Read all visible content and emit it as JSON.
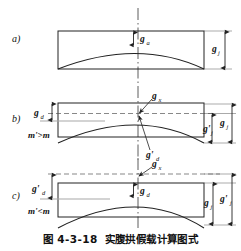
{
  "figure": {
    "caption_number": "图 4-3-18",
    "caption_title": "实腹拱假载计算图式"
  },
  "panels": [
    {
      "key": "a",
      "panel_label": "a)",
      "center_label": "g",
      "center_sub": "a",
      "right_label": "g",
      "right_sub": "j",
      "mass_note": "",
      "inner_left_label": "",
      "inner_left_sub": "",
      "second_right_label": "",
      "second_right_sub": "",
      "arrow_label": "",
      "arrow_sub": "",
      "lower_arrow_label": "",
      "lower_arrow_sub": ""
    },
    {
      "key": "b",
      "panel_label": "b)",
      "center_label": "",
      "center_sub": "",
      "right_label": "g",
      "right_sub": "j",
      "mass_note": "m'>m",
      "inner_left_label": "g",
      "inner_left_sub": "d",
      "second_right_label": "g'",
      "second_right_sub": "j",
      "arrow_label": "g",
      "arrow_sub": "x",
      "lower_arrow_label": "g'",
      "lower_arrow_sub": "d"
    },
    {
      "key": "c",
      "panel_label": "c)",
      "center_label": "g",
      "center_sub": "d",
      "right_label": "g",
      "right_sub": "j",
      "mass_note": "m'<m",
      "inner_left_label": "g'",
      "inner_left_sub": "d",
      "second_right_label": "g'",
      "second_right_sub": "j",
      "arrow_label": "g",
      "arrow_sub": "x",
      "lower_arrow_label": "",
      "lower_arrow_sub": ""
    }
  ],
  "colors": {
    "line": "#222222",
    "thin": "#3a3a3a",
    "gray": "#9a9a9a",
    "text": "#111111"
  }
}
